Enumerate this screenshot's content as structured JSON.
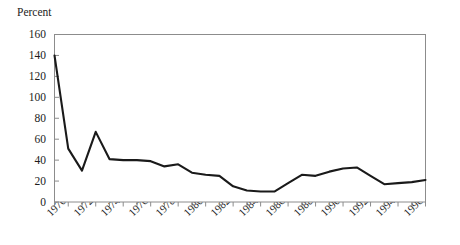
{
  "chart_data": {
    "type": "line",
    "title": "",
    "ylabel": "Percent",
    "xlabel": "",
    "ylim": [
      0,
      160
    ],
    "yticks": [
      0,
      20,
      40,
      60,
      80,
      100,
      120,
      140,
      160
    ],
    "xlim": [
      1970,
      1997
    ],
    "xticks": [
      1970,
      1971,
      1972,
      1973,
      1974,
      1975,
      1976,
      1977,
      1978,
      1979,
      1980,
      1981,
      1982,
      1983,
      1984,
      1985,
      1986,
      1987,
      1988,
      1989,
      1990,
      1991,
      1992,
      1993,
      1994,
      1995,
      1996,
      1997
    ],
    "xticklabels": [
      "1970",
      "1972",
      "1974",
      "1976",
      "1978",
      "1980",
      "1982",
      "1984",
      "1986",
      "1988",
      "1990",
      "1992",
      "1994",
      "1996"
    ],
    "grid": false,
    "legend": "none",
    "line_color": "#1a1a1a",
    "axis_color": "#8c8c8c",
    "x": [
      1970,
      1971,
      1972,
      1973,
      1974,
      1975,
      1976,
      1977,
      1978,
      1979,
      1980,
      1981,
      1982,
      1983,
      1984,
      1985,
      1986,
      1987,
      1988,
      1989,
      1990,
      1991,
      1992,
      1993,
      1994,
      1995,
      1996,
      1997
    ],
    "values": [
      140,
      51,
      30,
      67,
      41,
      40,
      40,
      39,
      34,
      36,
      28,
      26,
      25,
      15,
      11,
      10,
      10,
      18,
      26,
      25,
      29,
      32,
      33,
      25,
      17,
      18,
      19,
      21
    ],
    "series": [
      {
        "name": "Percent",
        "values": [
          140,
          51,
          30,
          67,
          41,
          40,
          40,
          39,
          34,
          36,
          28,
          26,
          25,
          15,
          11,
          10,
          10,
          18,
          26,
          25,
          29,
          32,
          33,
          25,
          17,
          18,
          19,
          21
        ]
      }
    ]
  },
  "axis": {
    "y_title": "Percent",
    "y_labels": [
      "160",
      "140",
      "120",
      "100",
      "80",
      "60",
      "40",
      "20",
      "0"
    ],
    "x_labels": [
      "1970",
      "1972",
      "1974",
      "1976",
      "1978",
      "1980",
      "1982",
      "1984",
      "1986",
      "1988",
      "1990",
      "1992",
      "1994",
      "1996"
    ]
  }
}
